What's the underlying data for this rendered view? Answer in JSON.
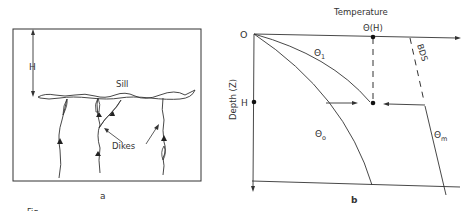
{
  "panel_a": {
    "label": "a",
    "depth_marker": "H",
    "sill_label": "Sill",
    "dikes_label": "Dikes"
  },
  "panel_b": {
    "label": "b",
    "x_axis_label": "Temperature",
    "y_axis_label": "Depth (Z)",
    "origin_label": "O",
    "depth_marker": "H",
    "theta_h_label": "Θ(H)",
    "theta1_label": "Θ",
    "theta1_sub": "1",
    "theta0_label": "Θ",
    "theta0_sub": "o",
    "thetam_label": "Θ",
    "thetam_sub": "m",
    "bds_label": "BDS"
  },
  "caption_fragment": "Fig."
}
